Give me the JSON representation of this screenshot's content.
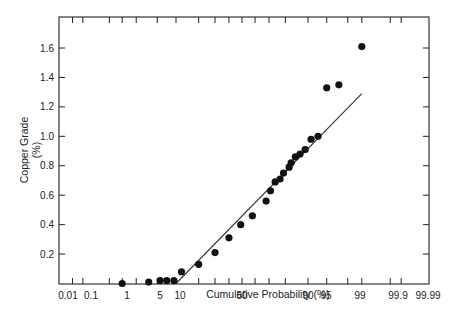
{
  "chart_data": {
    "type": "scatter",
    "title": "",
    "xlabel": "Cumulative Probability (%)",
    "ylabel": "Copper Grade (%)",
    "ylabel_lines": [
      "Copper Grade",
      "(%)"
    ],
    "x_scale": "normal-probability",
    "x_tick_labels": [
      "0.01",
      "0.1",
      "1",
      "5",
      "10",
      "50",
      "90",
      "95",
      "99",
      "99.9",
      "99.99"
    ],
    "x_tick_values": [
      0.01,
      0.1,
      1,
      5,
      10,
      50,
      90,
      95,
      99,
      99.9,
      99.99
    ],
    "y_tick_labels": [
      "0.2",
      "0.4",
      "0.6",
      "0.8",
      "1.0",
      "1.2",
      "1.4",
      "1.6"
    ],
    "y_tick_values": [
      0.2,
      0.4,
      0.6,
      0.8,
      1.0,
      1.2,
      1.4,
      1.6
    ],
    "ylim": [
      0,
      1.76
    ],
    "xlim": [
      0.01,
      99.99
    ],
    "grid": false,
    "legend": null,
    "series": [
      {
        "name": "Samples",
        "kind": "points",
        "x": [
          1,
          3.5,
          5.6,
          7.2,
          9.3,
          12,
          20,
          30,
          40,
          49,
          58,
          68,
          71,
          74,
          77,
          79,
          82,
          83,
          85,
          87,
          89,
          91,
          93,
          95,
          97,
          99
        ],
        "y": [
          0.0,
          0.01,
          0.02,
          0.02,
          0.02,
          0.08,
          0.13,
          0.21,
          0.31,
          0.4,
          0.46,
          0.56,
          0.63,
          0.69,
          0.71,
          0.75,
          0.79,
          0.82,
          0.86,
          0.88,
          0.91,
          0.98,
          1.0,
          1.33,
          1.35,
          1.61
        ]
      },
      {
        "name": "Fitted line",
        "kind": "line",
        "x": [
          10,
          99
        ],
        "y": [
          0.0,
          1.29
        ]
      }
    ]
  },
  "page": {
    "cropped_caption": "...caption text cropped at top edge..."
  }
}
